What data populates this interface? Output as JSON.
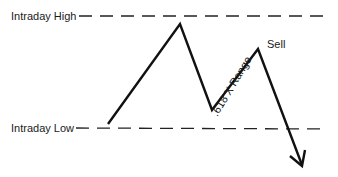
{
  "diagram": {
    "labels": {
      "high": "Intraday High",
      "low": "Intraday Low",
      "sell": "Sell",
      "range": ".618 X Range"
    },
    "levels": {
      "high_y": 16,
      "low_y": 128
    },
    "price_path": [
      [
        108,
        124
      ],
      [
        180,
        24
      ],
      [
        212,
        110
      ],
      [
        258,
        49
      ],
      [
        302,
        165
      ]
    ],
    "colors": {
      "line": "#111111",
      "dash": "#222222",
      "background": "#ffffff"
    }
  }
}
